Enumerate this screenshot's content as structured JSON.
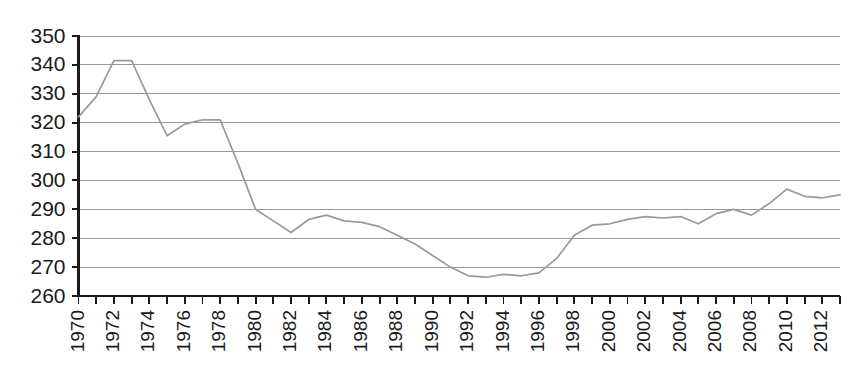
{
  "chart_data": {
    "type": "line",
    "title": "",
    "subtitle": "",
    "xlabel": "",
    "ylabel": "",
    "grid": true,
    "legend": false,
    "legend_position": "none",
    "line_color": "#9a9a9a",
    "axis_color": "#1a1a1a",
    "gridline_color": "#8c8c8c",
    "background_color": "#ffffff",
    "xlim": [
      1970,
      2013
    ],
    "ylim": [
      260,
      350
    ],
    "ytick_values": [
      260,
      270,
      280,
      290,
      300,
      310,
      320,
      330,
      340,
      350
    ],
    "ytick_labels": [
      "260",
      "270",
      "280",
      "290",
      "300",
      "310",
      "320",
      "330",
      "340",
      "350"
    ],
    "xtick_values": [
      1970,
      1971,
      1972,
      1973,
      1974,
      1975,
      1976,
      1977,
      1978,
      1979,
      1980,
      1981,
      1982,
      1983,
      1984,
      1985,
      1986,
      1987,
      1988,
      1989,
      1990,
      1991,
      1992,
      1993,
      1994,
      1995,
      1996,
      1997,
      1998,
      1999,
      2000,
      2001,
      2002,
      2003,
      2004,
      2005,
      2006,
      2007,
      2008,
      2009,
      2010,
      2011,
      2012,
      2013
    ],
    "xtick_labels_shown": [
      "1970",
      "1972",
      "1974",
      "1976",
      "1978",
      "1980",
      "1982",
      "1984",
      "1986",
      "1988",
      "1990",
      "1992",
      "1994",
      "1996",
      "1998",
      "2000",
      "2002",
      "2004",
      "2006",
      "2008",
      "2010",
      "2012"
    ],
    "xtick_label_rotation": -90,
    "x": [
      1970,
      1971,
      1972,
      1973,
      1974,
      1975,
      1976,
      1977,
      1978,
      1979,
      1980,
      1981,
      1982,
      1983,
      1984,
      1985,
      1986,
      1987,
      1988,
      1989,
      1990,
      1991,
      1992,
      1993,
      1994,
      1995,
      1996,
      1997,
      1998,
      1999,
      2000,
      2001,
      2002,
      2003,
      2004,
      2005,
      2006,
      2007,
      2008,
      2009,
      2010,
      2011,
      2012,
      2013
    ],
    "y": [
      322.0,
      329.0,
      341.5,
      341.5,
      328.0,
      315.5,
      319.5,
      321.0,
      321.0,
      306.0,
      290.0,
      286.0,
      282.0,
      286.5,
      288.0,
      286.0,
      285.5,
      284.0,
      281.0,
      278.0,
      274.0,
      270.0,
      267.0,
      266.5,
      267.5,
      267.0,
      268.0,
      273.0,
      281.0,
      284.5,
      285.0,
      286.5,
      287.5,
      287.0,
      287.5,
      285.0,
      288.5,
      290.0,
      288.0,
      292.0,
      297.0,
      294.5,
      294.0,
      295.0
    ]
  }
}
